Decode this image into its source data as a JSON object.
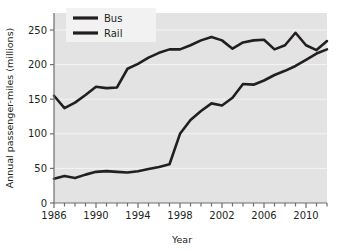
{
  "chart_data": {
    "type": "line",
    "title": "",
    "xlabel": "Year",
    "ylabel": "Annual passenger-miles (millions)",
    "xlim": [
      1986,
      2012
    ],
    "ylim": [
      0,
      270
    ],
    "yticks": [
      0,
      50,
      100,
      150,
      200,
      250
    ],
    "xticks": [
      1986,
      1990,
      1994,
      1998,
      2002,
      2006,
      2010
    ],
    "xtick_minor_step": 1,
    "grid": "horizontal",
    "legend_position": "top-left",
    "plot_background": "#e3e3e3",
    "line_color": "#231f20",
    "x": [
      1986,
      1987,
      1988,
      1989,
      1990,
      1991,
      1992,
      1993,
      1994,
      1995,
      1996,
      1997,
      1998,
      1999,
      2000,
      2001,
      2002,
      2003,
      2004,
      2005,
      2006,
      2007,
      2008,
      2009,
      2010,
      2011,
      2012
    ],
    "series": [
      {
        "name": "Bus",
        "values": [
          155,
          137,
          145,
          156,
          168,
          166,
          167,
          194,
          201,
          210,
          217,
          222,
          222,
          228,
          235,
          240,
          235,
          223,
          232,
          235,
          236,
          222,
          228,
          246,
          228,
          221,
          234
        ]
      },
      {
        "name": "Rail",
        "values": [
          35,
          39,
          36,
          41,
          45,
          46,
          45,
          44,
          46,
          49,
          52,
          56,
          100,
          120,
          133,
          144,
          141,
          152,
          172,
          171,
          177,
          185,
          191,
          198,
          207,
          216,
          222
        ]
      }
    ]
  },
  "legend": {
    "items": [
      {
        "label": "Bus"
      },
      {
        "label": "Rail"
      }
    ]
  },
  "axes": {
    "x_label": "Year",
    "y_label": "Annual passenger-miles (millions)",
    "y_tick_labels": [
      "0",
      "50",
      "100",
      "150",
      "200",
      "250"
    ],
    "x_tick_labels": [
      "1986",
      "1990",
      "1994",
      "1998",
      "2002",
      "2006",
      "2010"
    ]
  }
}
